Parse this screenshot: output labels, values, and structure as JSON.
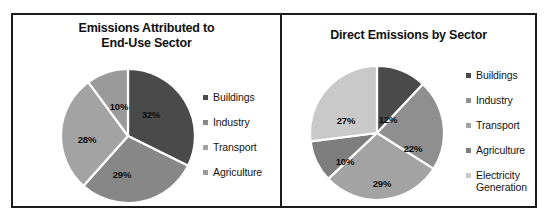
{
  "figure": {
    "background_color": "#ffffff",
    "frame_color": "#1a1a1a"
  },
  "panels": [
    {
      "id": "left",
      "title": "Emissions Attributed to\nEnd-Use Sector",
      "title_line1": "Emissions Attributed to",
      "title_line2": "End-Use Sector",
      "legend": [
        {
          "label": "Buildings",
          "color": "#4a4a4a"
        },
        {
          "label": "Industry",
          "color": "#878787"
        },
        {
          "label": "Transport",
          "color": "#a3a3a3"
        },
        {
          "label": "Agriculture",
          "color": "#9a9a9a"
        }
      ]
    },
    {
      "id": "right",
      "title": "Direct Emissions by Sector",
      "title_line1": "Direct Emissions by Sector",
      "title_line2": "",
      "legend": [
        {
          "label": "Buildings",
          "color": "#4a4a4a"
        },
        {
          "label": "Industry",
          "color": "#8f8f8f"
        },
        {
          "label": "Transport",
          "color": "#a3a3a3"
        },
        {
          "label": "Agriculture",
          "color": "#7e7e7e"
        },
        {
          "label": "Electricity\nGeneration",
          "color": "#c9c9c9"
        }
      ]
    }
  ],
  "chart_data": [
    {
      "type": "pie",
      "title": "Emissions Attributed to End-Use Sector",
      "xlabel": "",
      "ylabel": "",
      "legend_position": "right",
      "start_angle_deg": 0,
      "direction": "clockwise",
      "separator_color": "#ffffff",
      "categories": [
        "Buildings",
        "Industry",
        "Transport",
        "Agriculture"
      ],
      "values": [
        32,
        29,
        28,
        10
      ],
      "labels": [
        "32%",
        "29%",
        "28%",
        "10%"
      ],
      "colors": [
        "#4a4a4a",
        "#878787",
        "#a3a3a3",
        "#9a9a9a"
      ],
      "units": "percent"
    },
    {
      "type": "pie",
      "title": "Direct Emissions by Sector",
      "xlabel": "",
      "ylabel": "",
      "legend_position": "right",
      "start_angle_deg": 0,
      "direction": "clockwise",
      "separator_color": "#ffffff",
      "categories": [
        "Buildings",
        "Industry",
        "Transport",
        "Agriculture",
        "Electricity Generation"
      ],
      "values": [
        12,
        22,
        29,
        10,
        27
      ],
      "labels": [
        "12%",
        "22%",
        "29%",
        "10%",
        "27%"
      ],
      "colors": [
        "#4a4a4a",
        "#8f8f8f",
        "#a3a3a3",
        "#7e7e7e",
        "#c9c9c9"
      ],
      "units": "percent"
    }
  ],
  "slice_labels": {
    "left": {
      "buildings": "32%",
      "industry": "29%",
      "transport": "28%",
      "agriculture": "10%"
    },
    "right": {
      "buildings": "12%",
      "industry": "22%",
      "transport": "29%",
      "agriculture": "10%",
      "electricity": "27%"
    }
  }
}
